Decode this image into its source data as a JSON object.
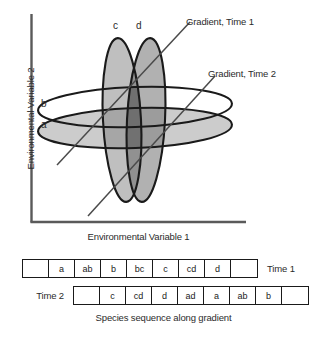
{
  "plot": {
    "x_axis_label": "Environmental Variable 1",
    "y_axis_label": "Environmental Variable 2",
    "ellipse_labels": {
      "a": "a",
      "b": "b",
      "c": "c",
      "d": "d"
    },
    "gradient_lines": [
      {
        "label": "Gradient, Time 1"
      },
      {
        "label": "Gradient, Time 2"
      }
    ]
  },
  "sequence": {
    "time1": {
      "label": "Time 1",
      "cells": [
        "",
        "a",
        "ab",
        "b",
        "bc",
        "c",
        "cd",
        "d",
        ""
      ]
    },
    "time2": {
      "label": "Time 2",
      "cells": [
        "",
        "c",
        "cd",
        "d",
        "ad",
        "a",
        "ab",
        "b",
        ""
      ]
    },
    "caption": "Species sequence along gradient"
  },
  "colors": {
    "stroke": "#1a1a1a",
    "axis": "#5a5a5a",
    "text": "#2b2b2b",
    "ellipse_c_fill": "#b9b9b9",
    "ellipse_d_fill": "#a8a8a8",
    "ellipse_a_fill": "#c9c9c9",
    "ellipse_b_fill": "#ffffff",
    "overlap_dark": "#8a8a8a"
  },
  "chart_data": {
    "type": "scatter",
    "title": "",
    "xlabel": "Environmental Variable 1",
    "ylabel": "Environmental Variable 2",
    "annotations": [
      "Gradient, Time 1",
      "Gradient, Time 2",
      "a",
      "b",
      "c",
      "d"
    ],
    "species_envelopes": [
      {
        "name": "a",
        "orientation": "horizontal",
        "fill": "#c9c9c9"
      },
      {
        "name": "b",
        "orientation": "horizontal",
        "fill": "#ffffff"
      },
      {
        "name": "c",
        "orientation": "vertical",
        "fill": "#b9b9b9"
      },
      {
        "name": "d",
        "orientation": "vertical",
        "fill": "#a8a8a8"
      }
    ],
    "sequences": [
      {
        "name": "Time 1",
        "values": [
          "",
          "a",
          "ab",
          "b",
          "bc",
          "c",
          "cd",
          "d",
          ""
        ]
      },
      {
        "name": "Time 2",
        "values": [
          "",
          "c",
          "cd",
          "d",
          "ad",
          "a",
          "ab",
          "b",
          ""
        ]
      }
    ]
  }
}
